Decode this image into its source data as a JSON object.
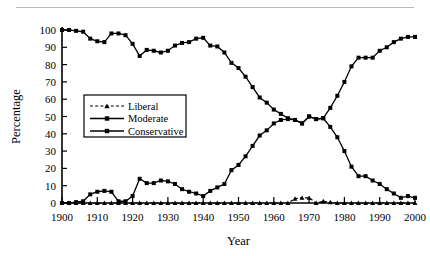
{
  "figure": {
    "top_rule": "horizontal-rule",
    "background_color": "#ffffff",
    "ink_color": "#000000"
  },
  "chart_data": {
    "type": "line",
    "title": "",
    "subtitle": "",
    "xlabel": "Year",
    "ylabel": "Percentage",
    "xlim": [
      1900,
      2000
    ],
    "ylim": [
      0,
      100
    ],
    "xticks": [
      1900,
      1910,
      1920,
      1930,
      1940,
      1950,
      1960,
      1970,
      1980,
      1990,
      2000
    ],
    "xtick_labels": [
      "1900",
      "1910",
      "1920",
      "1930",
      "1940",
      "1950",
      "1960",
      "1970",
      "1980",
      "1990",
      "2000"
    ],
    "yticks": [
      0,
      10,
      20,
      30,
      40,
      50,
      60,
      70,
      80,
      90,
      100
    ],
    "ytick_labels": [
      "0",
      "10",
      "20",
      "30",
      "40",
      "50",
      "60",
      "70",
      "80",
      "90",
      "100"
    ],
    "grid": false,
    "legend_position": "center-left",
    "legend_entries": [
      "Liberal",
      "Moderate",
      "Conservative"
    ],
    "x": [
      1900,
      1902,
      1904,
      1906,
      1908,
      1910,
      1912,
      1914,
      1916,
      1918,
      1920,
      1922,
      1924,
      1926,
      1928,
      1930,
      1932,
      1934,
      1936,
      1938,
      1940,
      1942,
      1944,
      1946,
      1948,
      1950,
      1952,
      1954,
      1956,
      1958,
      1960,
      1962,
      1964,
      1966,
      1968,
      1970,
      1972,
      1974,
      1976,
      1978,
      1980,
      1982,
      1984,
      1986,
      1988,
      1990,
      1992,
      1994,
      1996,
      1998,
      2000
    ],
    "series": [
      {
        "name": "Liberal",
        "style": "dashed",
        "marker": "triangle",
        "values": [
          0,
          0,
          0,
          0,
          0,
          0,
          0,
          0,
          0,
          0,
          0,
          0,
          0,
          0,
          0,
          0,
          0,
          0,
          0,
          0,
          0,
          0,
          0,
          0,
          0,
          0,
          0,
          0,
          0,
          0,
          0,
          0,
          0,
          2.5,
          3,
          3,
          0,
          1,
          0.5,
          0,
          0,
          0,
          0,
          0,
          0,
          0,
          0,
          0,
          0,
          0,
          0
        ]
      },
      {
        "name": "Moderate",
        "style": "solid",
        "marker": "square",
        "values": [
          0,
          0,
          0.5,
          1,
          5,
          6.5,
          7,
          6.5,
          1,
          1,
          4,
          14,
          11.5,
          11.5,
          13,
          12.5,
          11,
          8,
          6.5,
          5.5,
          4,
          7,
          9,
          11,
          19,
          22,
          27,
          33,
          39,
          42,
          46,
          48,
          48.5,
          48,
          46,
          50,
          48.5,
          49,
          44,
          38,
          30,
          21,
          15.5,
          15.5,
          13,
          11,
          8,
          5.5,
          3,
          4,
          3
        ]
      },
      {
        "name": "Conservative",
        "style": "solid",
        "marker": "square",
        "values": [
          100,
          100,
          99.5,
          99,
          95,
          93.5,
          93,
          98,
          98,
          97,
          92,
          85,
          88.5,
          88,
          87,
          88,
          91,
          92.5,
          93,
          95,
          95.5,
          91,
          90.5,
          87,
          81,
          78,
          73,
          67,
          61,
          58,
          54,
          51.5,
          49,
          48,
          46,
          50,
          48.5,
          49,
          55,
          62,
          70,
          79,
          84,
          84,
          84,
          88,
          90,
          93,
          95,
          96,
          96
        ]
      }
    ]
  }
}
